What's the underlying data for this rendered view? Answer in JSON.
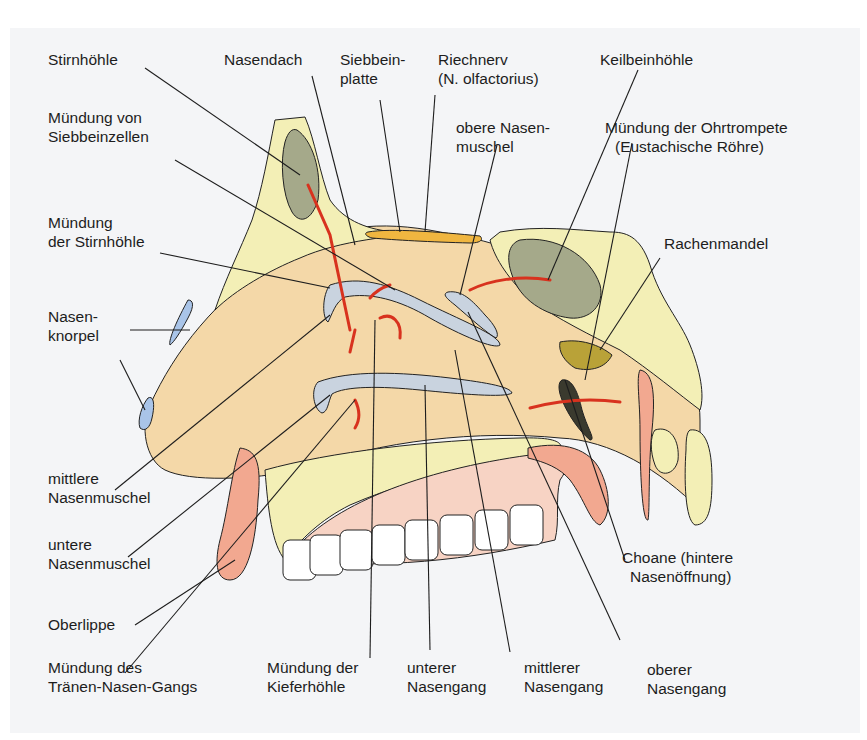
{
  "figure": {
    "colors": {
      "background": "#f4f5f7",
      "bone": "#f3efb6",
      "bone_dots": "#4e5a3a",
      "sinus": "#a5a98a",
      "sinus_dark": "#3a3a2e",
      "nasal_cavity": "#f4d8a8",
      "mucosa": "#f2a890",
      "cartilage": "#a9c4e8",
      "olfactory": "#f0b640",
      "adenoid": "#b9a238",
      "arrow": "#d8321e",
      "teeth": "#ffffff",
      "palate": "#f7d3c4"
    },
    "labels": [
      {
        "id": "stirnhoehle",
        "lines": [
          "Stirnhöhle"
        ]
      },
      {
        "id": "nasendach",
        "lines": [
          "Nasendach"
        ]
      },
      {
        "id": "siebbeinplatte",
        "lines": [
          "Siebbein-",
          "platte"
        ]
      },
      {
        "id": "riechnerv",
        "lines": [
          "Riechnerv",
          "(N. olfactorius)"
        ]
      },
      {
        "id": "keilbeinhoehle",
        "lines": [
          "Keilbeinhöhle"
        ]
      },
      {
        "id": "muendung-siebbeinzellen",
        "lines": [
          "Mündung von",
          "Siebbeinzellen"
        ]
      },
      {
        "id": "obere-nasenmuschel",
        "lines": [
          "obere Nasen-",
          "muschel"
        ]
      },
      {
        "id": "muendung-ohrtrompete",
        "lines": [
          "Mündung der Ohrtrompete",
          "(Eustachische Röhre)"
        ]
      },
      {
        "id": "muendung-stirnhoehle",
        "lines": [
          "Mündung",
          "der Stirnhöhle"
        ]
      },
      {
        "id": "rachenmandel",
        "lines": [
          "Rachenmandel"
        ]
      },
      {
        "id": "nasenknorpel",
        "lines": [
          "Nasen-",
          "knorpel"
        ]
      },
      {
        "id": "mittlere-nasenmuschel",
        "lines": [
          "mittlere",
          "Nasenmuschel"
        ]
      },
      {
        "id": "untere-nasenmuschel",
        "lines": [
          "untere",
          "Nasenmuschel"
        ]
      },
      {
        "id": "choane",
        "lines": [
          "Choane (hintere",
          "Nasenöffnung)"
        ]
      },
      {
        "id": "oberlippe",
        "lines": [
          "Oberlippe"
        ]
      },
      {
        "id": "muendung-traenen-nasen-gang",
        "lines": [
          "Mündung des",
          "Tränen-Nasen-Gangs"
        ]
      },
      {
        "id": "muendung-kieferhoehle",
        "lines": [
          "Mündung der",
          "Kieferhöhle"
        ]
      },
      {
        "id": "unterer-nasengang",
        "lines": [
          "unterer",
          "Nasengang"
        ]
      },
      {
        "id": "mittlerer-nasengang",
        "lines": [
          "mittlerer",
          "Nasengang"
        ]
      },
      {
        "id": "oberer-nasengang",
        "lines": [
          "oberer",
          "Nasengang"
        ]
      }
    ]
  }
}
